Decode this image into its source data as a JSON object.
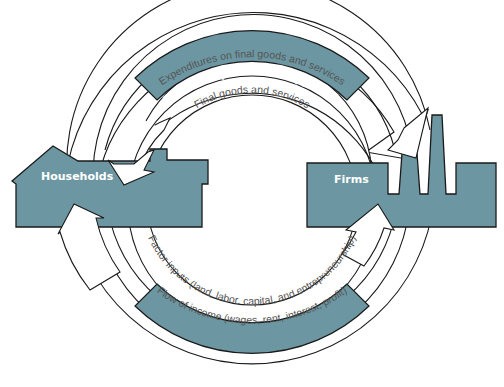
{
  "diagram": {
    "type": "circular-flow",
    "colors": {
      "accent": "#6c97a2",
      "stroke": "#1a1a1a",
      "label_text": "#555555",
      "band_text": "#ffffff"
    },
    "nodes": {
      "households": {
        "label": "Households",
        "shape": "house"
      },
      "firms": {
        "label": "Firms",
        "shape": "factory"
      }
    },
    "top_flow": {
      "band_label": "Flow of expenditures approach",
      "outer_label": "Expenditures on final goods and services",
      "inner_label": "Final goods and services",
      "outer_arrow_direction": "households-to-firms",
      "inner_arrow_direction": "firms-to-households"
    },
    "bottom_flow": {
      "band_label": "Flow of earnings approach",
      "inner_label": "Factor inputs (land, labor, capital, and entrepreneurship)",
      "outer_label": "Flow of income (wages, rent, interest, profit)",
      "inner_arrow_direction": "households-to-firms",
      "outer_arrow_direction": "firms-to-households"
    }
  }
}
